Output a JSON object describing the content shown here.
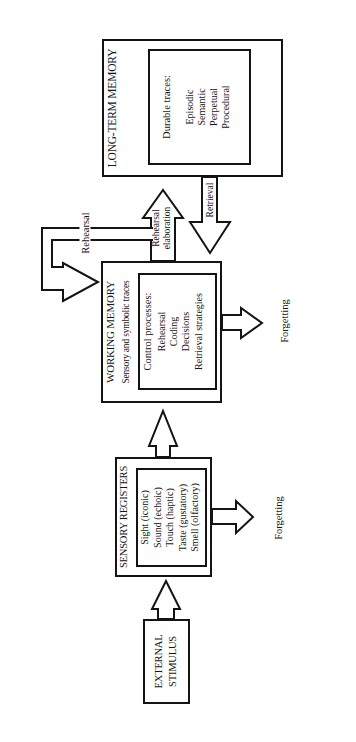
{
  "colors": {
    "ink": "#141414",
    "paper": "#ffffff"
  },
  "boxes": {
    "external_stimulus": {
      "line1": "EXTERNAL",
      "line2": "STIMULUS"
    },
    "sensory_registers": {
      "title": "SENSORY REGISTERS",
      "items": [
        "Sight (iconic)",
        "Sound (echoic)",
        "Touch (haptic)",
        "Taste (gustatory)",
        "Smell (olfactory)"
      ]
    },
    "working_memory": {
      "title": "WORKING MEMORY",
      "subtitle": "Sensory and symbolic traces",
      "inner_heading": "Control processes:",
      "items": [
        "Rehearsal",
        "Coding",
        "Decisions",
        "Retrieval strategies"
      ]
    },
    "long_term_memory": {
      "title": "LONG-TERM MEMORY",
      "inner_heading": "Durable traces:",
      "items": [
        "Episodic",
        "Semantic",
        "Perpetual",
        "Procedural"
      ]
    }
  },
  "arrow_labels": {
    "rehearsal_loop": "Rehearsal",
    "rehearsal_elaboration": [
      "Rehearsal",
      "elaboration"
    ],
    "retrieval": "Retrieval",
    "forgetting_sensory": "Forgetting",
    "forgetting_working": "Forgetting"
  }
}
